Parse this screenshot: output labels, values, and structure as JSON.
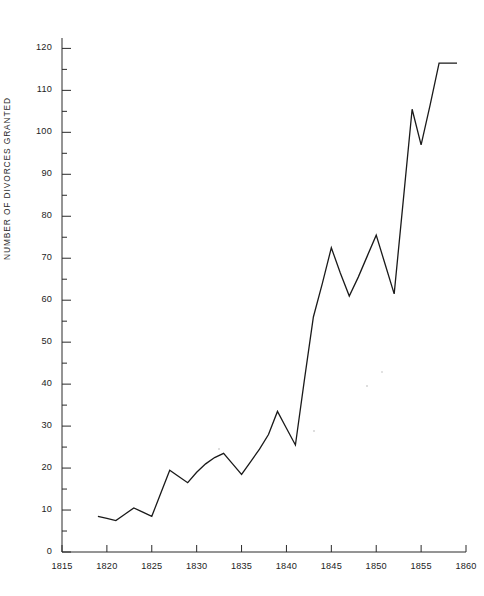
{
  "chart_data": {
    "type": "line",
    "title": "",
    "subtitle": "",
    "xlabel": "",
    "ylabel": "NUMBER OF DIVORCES GRANTED",
    "xlim": [
      1815,
      1860
    ],
    "ylim": [
      0,
      122
    ],
    "grid": false,
    "legend": null,
    "x_ticks": [
      1815,
      1820,
      1825,
      1830,
      1835,
      1840,
      1845,
      1850,
      1855,
      1860
    ],
    "x_tick_labels": [
      "1815",
      "1820",
      "1825",
      "1830",
      "1835",
      "1840",
      "1845",
      "1850",
      "1855",
      "1860"
    ],
    "x_minor_tick_interval": 5,
    "y_ticks": [
      0,
      10,
      20,
      30,
      40,
      50,
      60,
      70,
      80,
      90,
      100,
      110,
      120
    ],
    "y_tick_labels": [
      "0",
      "10",
      "20",
      "30",
      "40",
      "50",
      "60",
      "70",
      "80",
      "90",
      "100",
      "110",
      "120"
    ],
    "y_minor_ticks": [
      5,
      15,
      25,
      35,
      45,
      55,
      65,
      75,
      85,
      95,
      105,
      115
    ],
    "line_color": "#1a1a1a",
    "line_width": 1.3,
    "markers": false,
    "x": [
      1819,
      1820,
      1821,
      1822,
      1823,
      1824,
      1825,
      1826,
      1827,
      1828,
      1829,
      1830,
      1831,
      1832,
      1833,
      1834,
      1835,
      1836,
      1837,
      1838,
      1839,
      1840,
      1841,
      1842,
      1843,
      1844,
      1845,
      1846,
      1847,
      1848,
      1849,
      1850,
      1851,
      1852,
      1853,
      1854,
      1855,
      1856,
      1857,
      1858,
      1859
    ],
    "values": [
      8.5,
      8.0,
      7.5,
      9.0,
      10.5,
      9.5,
      8.5,
      14.0,
      19.5,
      18.0,
      16.5,
      19.0,
      21.0,
      22.5,
      23.5,
      21.0,
      18.5,
      21.5,
      24.5,
      28.0,
      33.5,
      29.5,
      25.5,
      41.0,
      56.0,
      64.0,
      72.5,
      66.5,
      61.0,
      65.5,
      70.5,
      75.5,
      68.5,
      61.5,
      83.5,
      105.5,
      97.0,
      106.5,
      116.5,
      116.5,
      116.5
    ],
    "series_name": "Divorces granted",
    "y_axis_max_value": 116.5,
    "y_axis_min_value": 7.5,
    "axis_color": "#2a2a2a"
  },
  "figure": {
    "plot_left_px": 62,
    "plot_right_px": 466,
    "plot_top_px": 40,
    "plot_bottom_px": 552
  }
}
